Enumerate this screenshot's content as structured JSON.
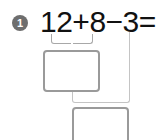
{
  "problem": {
    "number": "1",
    "expression": "12+8−3=",
    "answer_boxes": [
      {
        "id": "intermediate",
        "value": ""
      },
      {
        "id": "final",
        "value": ""
      }
    ]
  },
  "colors": {
    "badge": "#6e6e6e",
    "text": "#111111",
    "box_border": "#9a9a9a",
    "line": "#c4c4c4"
  }
}
